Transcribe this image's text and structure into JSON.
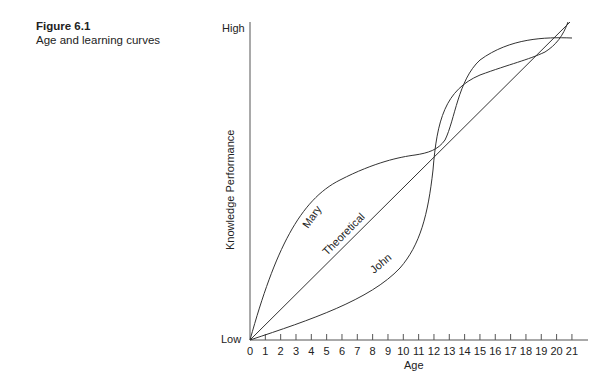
{
  "caption": {
    "figure_label": "Figure 6.1",
    "subtitle": "Age and learning curves"
  },
  "chart_data": {
    "type": "line",
    "title": "Figure 6.1 Age and learning curves",
    "xlabel": "Age",
    "ylabel": "Knowledge Performance",
    "x_ticks": [
      "0",
      "1",
      "2",
      "3",
      "4",
      "5",
      "6",
      "7",
      "8",
      "9",
      "10",
      "11",
      "12",
      "13",
      "14",
      "15",
      "16",
      "17",
      "18",
      "19",
      "20",
      "21"
    ],
    "y_ticks": [
      "Low",
      "High"
    ],
    "xlim": [
      0,
      21
    ],
    "ylim": [
      "Low",
      "High"
    ],
    "grid": false,
    "legend": "inline labels on curves",
    "series": [
      {
        "name": "Mary",
        "description": "Rises quickly early, plateaus around ages 9-12, rises again and levels off at high near age 20-21",
        "points": [
          [
            0,
            0
          ],
          [
            2,
            0.32
          ],
          [
            4,
            0.48
          ],
          [
            6,
            0.55
          ],
          [
            8,
            0.58
          ],
          [
            10,
            0.6
          ],
          [
            12,
            0.62
          ],
          [
            13,
            0.75
          ],
          [
            14,
            0.86
          ],
          [
            16,
            0.94
          ],
          [
            18,
            0.96
          ],
          [
            20,
            0.97
          ],
          [
            21,
            0.96
          ]
        ]
      },
      {
        "name": "Theoretical",
        "description": "Linear increase from low at age 0 to high at age 21",
        "points": [
          [
            0,
            0
          ],
          [
            21,
            1.0
          ]
        ]
      },
      {
        "name": "John",
        "description": "Slow early growth, crosses others around age 12, rises steeply to high by age 19-20",
        "points": [
          [
            0,
            0
          ],
          [
            2,
            0.06
          ],
          [
            4,
            0.13
          ],
          [
            6,
            0.2
          ],
          [
            8,
            0.29
          ],
          [
            10,
            0.4
          ],
          [
            11,
            0.48
          ],
          [
            12,
            0.6
          ],
          [
            14,
            0.78
          ],
          [
            16,
            0.86
          ],
          [
            18,
            0.92
          ],
          [
            19,
            0.97
          ],
          [
            19.4,
            1.0
          ]
        ]
      }
    ]
  },
  "axis": {
    "y_high": "High",
    "y_low": "Low",
    "y_title": "Knowledge Performance",
    "x_title": "Age",
    "x_ticks": [
      "0",
      "1",
      "2",
      "3",
      "4",
      "5",
      "6",
      "7",
      "8",
      "9",
      "10",
      "11",
      "12",
      "13",
      "14",
      "15",
      "16",
      "17",
      "18",
      "19",
      "20",
      "21"
    ]
  },
  "curve_labels": {
    "mary": "Mary",
    "theoretical": "Theoretical",
    "john": "John"
  },
  "colors": {
    "line": "#333333",
    "axis": "#555555",
    "text": "#222222"
  }
}
